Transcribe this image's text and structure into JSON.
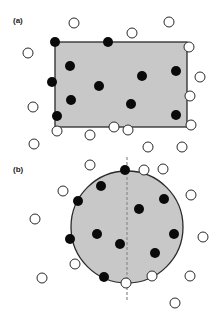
{
  "colors": {
    "fill_region": "#c8c8c8",
    "stroke": "#2a2a2a",
    "filled_point": "#0a0a0a",
    "open_point_fill": "#ffffff",
    "dashed_line": "#8a8a8a"
  },
  "panel_a": {
    "label": "(a)",
    "label_pos": [
      13,
      23
    ],
    "shape": "rectangle",
    "rect": {
      "x": 55,
      "y": 42,
      "w": 132,
      "h": 85
    },
    "filled_points": [
      [
        55,
        42
      ],
      [
        108,
        42
      ],
      [
        70,
        66
      ],
      [
        52,
        82
      ],
      [
        142,
        76
      ],
      [
        176,
        71
      ],
      [
        99,
        86
      ],
      [
        71,
        100
      ],
      [
        131,
        104
      ],
      [
        57,
        116
      ],
      [
        176,
        115
      ]
    ],
    "open_points": [
      [
        74,
        23
      ],
      [
        132,
        33
      ],
      [
        169,
        22
      ],
      [
        28,
        53
      ],
      [
        189,
        47
      ],
      [
        200,
        77
      ],
      [
        190,
        96
      ],
      [
        33,
        107
      ],
      [
        57,
        131
      ],
      [
        90,
        135
      ],
      [
        114,
        127
      ],
      [
        128,
        130
      ],
      [
        191,
        125
      ]
    ]
  },
  "panel_b": {
    "label": "(b)",
    "label_pos": [
      13,
      172
    ],
    "shape": "circle",
    "circle": {
      "cx": 127,
      "cy": 227,
      "r": 56
    },
    "dashed_line": {
      "x": 127,
      "y1": 157,
      "y2": 302
    },
    "filled_points": [
      [
        125,
        170
      ],
      [
        101,
        186
      ],
      [
        78,
        201
      ],
      [
        139,
        209
      ],
      [
        164,
        199
      ],
      [
        97,
        234
      ],
      [
        70,
        239
      ],
      [
        174,
        234
      ],
      [
        120,
        244
      ],
      [
        155,
        253
      ],
      [
        104,
        277
      ]
    ],
    "open_points": [
      [
        34,
        144
      ],
      [
        148,
        147
      ],
      [
        182,
        147
      ],
      [
        90,
        165
      ],
      [
        144,
        170
      ],
      [
        163,
        169
      ],
      [
        63,
        191
      ],
      [
        191,
        195
      ],
      [
        35,
        219
      ],
      [
        203,
        237
      ],
      [
        75,
        264
      ],
      [
        42,
        278
      ],
      [
        152,
        276
      ],
      [
        126,
        283
      ],
      [
        190,
        276
      ],
      [
        175,
        303
      ]
    ]
  },
  "point_radius": 5
}
